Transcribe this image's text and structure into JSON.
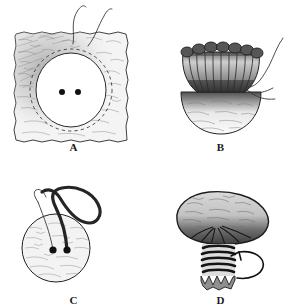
{
  "figure": {
    "background_color": "#ffffff",
    "ink_color": "#1a1a1a",
    "fabric_fill": "#f2f2f2",
    "shade_dark": "#4a4a4a",
    "shade_mid": "#9a9a9a",
    "thread_color": "#2b2b2b",
    "panel_count": 4
  },
  "panels": [
    {
      "id": "A",
      "label": "A",
      "name": "fabric-square-with-button-outline",
      "caption_text": "A",
      "elements": {
        "fabric_shape": "torn-edge square",
        "button_outline": "circle",
        "button_holes": 2,
        "stitch_line": "dashed running stitch circle",
        "threads_visible": 2
      }
    },
    {
      "id": "B",
      "label": "B",
      "name": "gathered-fabric-pouch",
      "caption_text": "B",
      "elements": {
        "top_shape": "ruffled gathered cup",
        "bottom_shape": "dome",
        "threads_visible": 1
      }
    },
    {
      "id": "C",
      "label": "C",
      "name": "button-with-thread-loop",
      "caption_text": "C",
      "elements": {
        "button_shape": "circle",
        "button_holes": 2,
        "thread_loop": "looped shank thread"
      }
    },
    {
      "id": "D",
      "label": "D",
      "name": "wrapped-button-shank",
      "caption_text": "D",
      "elements": {
        "cap_shape": "mushroom cap",
        "shank_wraps": 6,
        "direction_arrow": "curved wrapping arrow"
      }
    }
  ]
}
